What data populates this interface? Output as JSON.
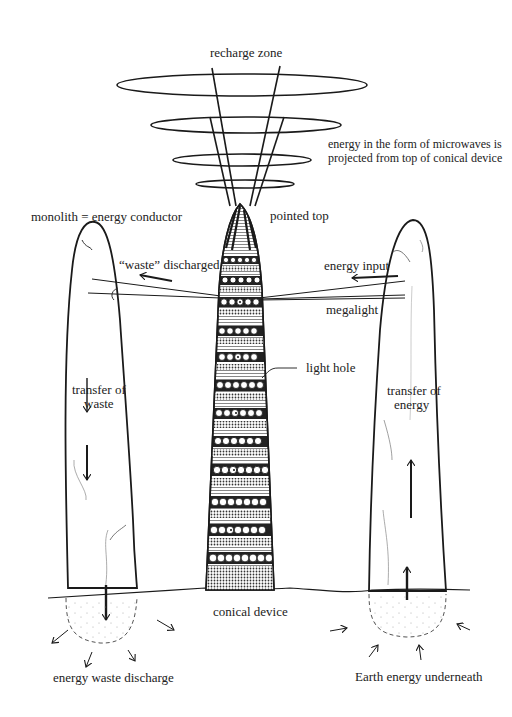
{
  "diagram": {
    "labels": {
      "recharge_zone": "recharge zone",
      "microwaves_line1": "energy in the form of microwaves is",
      "microwaves_line2": "projected from top of conical device",
      "monolith": "monolith = energy conductor",
      "pointed_top": "pointed top",
      "waste_discharged": "“waste” discharged",
      "energy_input": "energy input",
      "megalight": "megalight",
      "light_hole": "light hole",
      "transfer_waste_line1": "transfer of",
      "transfer_waste_line2": "waste",
      "transfer_energy_line1": "transfer of",
      "transfer_energy_line2": "energy",
      "conical_device": "conical device",
      "energy_waste_discharge": "energy waste discharge",
      "earth_energy": "Earth energy underneath"
    },
    "components": {
      "recharge_rings": 4,
      "conical_device_bands": 16,
      "monoliths": [
        "left: energy conductor (waste)",
        "right: energy conductor (input)"
      ]
    },
    "colors": {
      "ink": "#1a1a1a",
      "background": "#ffffff",
      "hatching": "#555555"
    }
  }
}
